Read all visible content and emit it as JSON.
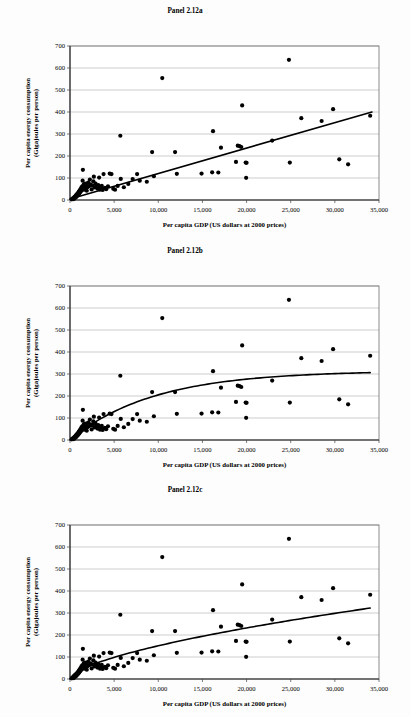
{
  "figure": {
    "panels": [
      {
        "id": "a",
        "title": "Panel 2.12a",
        "fit_type": "linear"
      },
      {
        "id": "b",
        "title": "Panel 2.12b",
        "fit_type": "saturating"
      },
      {
        "id": "c",
        "title": "Panel 2.12c",
        "fit_type": "logarithmic"
      }
    ]
  },
  "axes": {
    "xlabel": "Per capita GDP (US dollars at 2000 prices)",
    "ylabel_line1": "Per capita energy consumption",
    "ylabel_line2": "(Gigajoules per person)",
    "x_ticks": [
      "0",
      "5,000",
      "10,000",
      "15,000",
      "20,000",
      "25,000",
      "30,000",
      "35,000"
    ],
    "y_ticks": [
      "0",
      "100",
      "200",
      "300",
      "400",
      "500",
      "600",
      "700"
    ],
    "xlim": [
      0,
      35000
    ],
    "ylim": [
      0,
      700
    ]
  },
  "colors": {
    "marker": "#000000",
    "curve": "#000000",
    "grid": "#9a9a9a",
    "frame": "#6e6e6e",
    "background": "#fdfdfd"
  },
  "chart_data": {
    "type": "scatter",
    "xlabel": "Per capita GDP (US dollars at 2000 prices)",
    "ylabel": "Per capita energy consumption (Gigajoules per person)",
    "xlim": [
      0,
      35000
    ],
    "ylim": [
      0,
      700
    ],
    "grid": true,
    "legend": "none",
    "x_ticks": [
      0,
      5000,
      10000,
      15000,
      20000,
      25000,
      30000,
      35000
    ],
    "y_ticks": [
      0,
      100,
      200,
      300,
      400,
      500,
      600,
      700
    ],
    "points": [
      [
        200,
        3
      ],
      [
        260,
        5
      ],
      [
        320,
        6
      ],
      [
        380,
        9
      ],
      [
        420,
        4
      ],
      [
        470,
        12
      ],
      [
        520,
        8
      ],
      [
        560,
        16
      ],
      [
        600,
        11
      ],
      [
        650,
        20
      ],
      [
        700,
        14
      ],
      [
        740,
        24
      ],
      [
        790,
        18
      ],
      [
        830,
        28
      ],
      [
        880,
        22
      ],
      [
        920,
        33
      ],
      [
        960,
        26
      ],
      [
        1000,
        38
      ],
      [
        1050,
        30
      ],
      [
        1100,
        44
      ],
      [
        1150,
        35
      ],
      [
        1200,
        50
      ],
      [
        1250,
        41
      ],
      [
        1300,
        57
      ],
      [
        1350,
        46
      ],
      [
        1400,
        62
      ],
      [
        1430,
        88
      ],
      [
        1460,
        137
      ],
      [
        1500,
        53
      ],
      [
        1550,
        70
      ],
      [
        1600,
        47
      ],
      [
        1650,
        60
      ],
      [
        1700,
        75
      ],
      [
        1760,
        55
      ],
      [
        1820,
        67
      ],
      [
        1900,
        42
      ],
      [
        1980,
        58
      ],
      [
        2050,
        79
      ],
      [
        2150,
        63
      ],
      [
        2250,
        93
      ],
      [
        2350,
        71
      ],
      [
        2450,
        48
      ],
      [
        2550,
        66
      ],
      [
        2650,
        85
      ],
      [
        2700,
        106
      ],
      [
        2800,
        57
      ],
      [
        2900,
        74
      ],
      [
        3000,
        60
      ],
      [
        3100,
        52
      ],
      [
        3200,
        68
      ],
      [
        3300,
        102
      ],
      [
        3400,
        47
      ],
      [
        3500,
        58
      ],
      [
        3600,
        64
      ],
      [
        3700,
        46
      ],
      [
        3800,
        118
      ],
      [
        3950,
        55
      ],
      [
        4100,
        49
      ],
      [
        4300,
        62
      ],
      [
        4500,
        120
      ],
      [
        4700,
        118
      ],
      [
        4900,
        51
      ],
      [
        5100,
        47
      ],
      [
        5400,
        64
      ],
      [
        5700,
        292
      ],
      [
        5750,
        96
      ],
      [
        6100,
        58
      ],
      [
        6600,
        73
      ],
      [
        7100,
        95
      ],
      [
        7600,
        118
      ],
      [
        7900,
        88
      ],
      [
        8700,
        83
      ],
      [
        9300,
        218
      ],
      [
        9500,
        108
      ],
      [
        10450,
        554
      ],
      [
        11900,
        218
      ],
      [
        12100,
        119
      ],
      [
        14900,
        120
      ],
      [
        16100,
        126
      ],
      [
        16200,
        313
      ],
      [
        16800,
        125
      ],
      [
        17100,
        238
      ],
      [
        18800,
        173
      ],
      [
        19000,
        247
      ],
      [
        19200,
        245
      ],
      [
        19400,
        241
      ],
      [
        19500,
        430
      ],
      [
        19900,
        170
      ],
      [
        20000,
        169
      ],
      [
        19950,
        101
      ],
      [
        22900,
        270
      ],
      [
        24800,
        637
      ],
      [
        24900,
        170
      ],
      [
        26200,
        372
      ],
      [
        28500,
        359
      ],
      [
        29800,
        413
      ],
      [
        30500,
        185
      ],
      [
        31500,
        162
      ],
      [
        34000,
        383
      ]
    ],
    "fits": {
      "a": {
        "label": "Linear fit",
        "form": "y = a + b*x",
        "a": 5,
        "b": 0.01157,
        "endpoints": [
          [
            0,
            5
          ],
          [
            34200,
            400
          ]
        ]
      },
      "b": {
        "label": "Saturating (exponential-approach) fit",
        "form": "y = L*(1 - exp(-x/k))",
        "L": 315,
        "k": 9500
      },
      "c": {
        "label": "Logarithmic / power fit",
        "form": "y = c*x^p",
        "c": 0.5,
        "p": 0.62
      }
    }
  }
}
